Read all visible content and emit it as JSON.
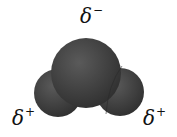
{
  "molecule": "water",
  "labels": {
    "top": {
      "symbol": "δ",
      "charge": "−"
    },
    "left": {
      "symbol": "δ",
      "charge": "+"
    },
    "right": {
      "symbol": "δ",
      "charge": "+"
    }
  },
  "colors": {
    "atom": "#4a4a4a",
    "atom_dark": "#2e2e2e",
    "background": "#ffffff"
  }
}
